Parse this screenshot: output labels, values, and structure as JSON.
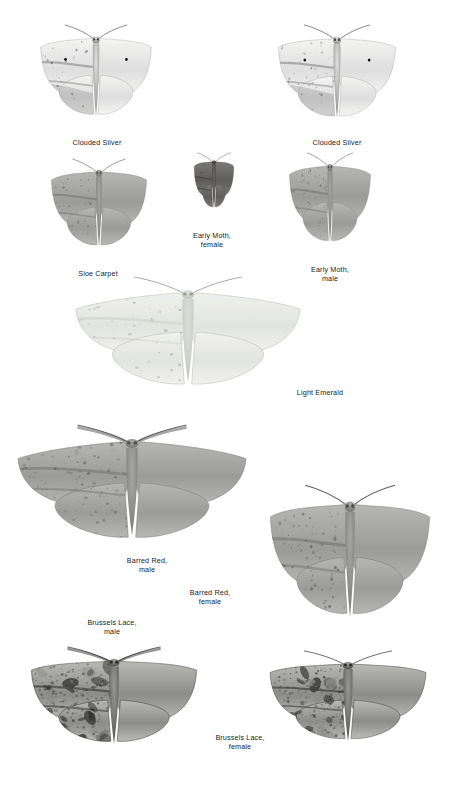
{
  "plate": {
    "background_color": "#ffffff",
    "text_color": "#1a1a1a",
    "width": 456,
    "height": 792,
    "kind": "field-guide-plate",
    "subject": "moths"
  },
  "specimens": [
    {
      "id": "clouded-silver-left",
      "label": "Clouded Silver",
      "common_name": "Clouded Silver",
      "sex": "",
      "pose": "wings-spread",
      "tone": "pale",
      "x": 25,
      "y": 24,
      "w": 142,
      "h": 106,
      "label_cx": 97,
      "label_y": 138
    },
    {
      "id": "clouded-silver-right",
      "label": "Clouded Silver",
      "common_name": "Clouded Silver",
      "sex": "",
      "pose": "wings-spread",
      "tone": "pale",
      "x": 262,
      "y": 24,
      "w": 150,
      "h": 108,
      "label_cx": 337,
      "label_y": 138
    },
    {
      "id": "sloe-carpet",
      "label": "Sloe Carpet",
      "common_name": "Sloe Carpet",
      "sex": "",
      "pose": "wings-spread",
      "tone": "mid-grey",
      "x": 38,
      "y": 158,
      "w": 122,
      "h": 102,
      "label_cx": 98,
      "label_y": 269
    },
    {
      "id": "early-moth-female",
      "label": "Early Moth,\nfemale",
      "common_name": "Early Moth",
      "sex": "female",
      "pose": "wings-spread-narrow",
      "tone": "dark",
      "x": 176,
      "y": 152,
      "w": 76,
      "h": 72,
      "label_cx": 212,
      "label_y": 231
    },
    {
      "id": "early-moth-male",
      "label": "Early Moth,\nmale",
      "common_name": "Early Moth",
      "sex": "male",
      "pose": "wings-spread",
      "tone": "mid-grey",
      "x": 278,
      "y": 152,
      "w": 104,
      "h": 104,
      "label_cx": 330,
      "label_y": 265
    },
    {
      "id": "light-emerald",
      "label": "Light Emerald",
      "common_name": "Light Emerald",
      "sex": "",
      "pose": "wings-spread-wide",
      "tone": "very-pale",
      "x": 66,
      "y": 276,
      "w": 244,
      "h": 124,
      "label_cx": 320,
      "label_y": 388
    },
    {
      "id": "barred-red-male",
      "label": "Barred Red,\nmale",
      "common_name": "Barred Red",
      "sex": "male",
      "pose": "wings-spread-wide",
      "tone": "mid-grey",
      "x": 8,
      "y": 424,
      "w": 248,
      "h": 130,
      "label_cx": 147,
      "label_y": 556
    },
    {
      "id": "barred-red-female",
      "label": "Barred Red,\nfemale",
      "common_name": "Barred Red",
      "sex": "female",
      "pose": "wings-spread",
      "tone": "mid-grey",
      "x": 248,
      "y": 484,
      "w": 204,
      "h": 152,
      "label_cx": 210,
      "label_y": 588
    },
    {
      "id": "brussels-lace-male",
      "label": "Brussels Lace,\nmale",
      "common_name": "Brussels Lace",
      "sex": "male",
      "pose": "wings-spread",
      "tone": "mottled-dark",
      "x": 8,
      "y": 646,
      "w": 212,
      "h": 112,
      "label_cx": 112,
      "label_y": 618
    },
    {
      "id": "brussels-lace-female",
      "label": "Brussels Lace,\nfemale",
      "common_name": "Brussels Lace",
      "sex": "female",
      "pose": "wings-spread",
      "tone": "mottled-dark",
      "x": 248,
      "y": 650,
      "w": 200,
      "h": 104,
      "label_cx": 240,
      "label_y": 733
    }
  ]
}
